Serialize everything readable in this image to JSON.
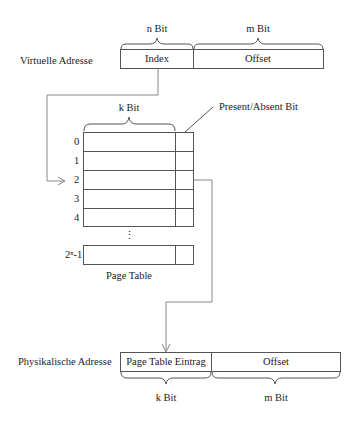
{
  "virtual_address": {
    "label": "Virtuelle Adresse",
    "fields": [
      {
        "name": "Index",
        "width_label": "n Bit"
      },
      {
        "name": "Offset",
        "width_label": "m Bit"
      }
    ]
  },
  "page_table": {
    "title": "Page Table",
    "entry_width_label": "k Bit",
    "flag_label": "Present/Absent Bit",
    "row_indices": [
      "0",
      "1",
      "2",
      "3",
      "4"
    ],
    "ellipsis": "⋮",
    "last_index": "2ⁿ-1",
    "selected_row": "2"
  },
  "physical_address": {
    "label": "Physikalische Adresse",
    "fields": [
      {
        "name": "Page Table Eintrag",
        "width_label": "k Bit"
      },
      {
        "name": "Offset",
        "width_label": "m Bit"
      }
    ]
  },
  "colors": {
    "box_stroke": "#555555",
    "arrow_stroke": "#888888",
    "text": "#222222"
  }
}
